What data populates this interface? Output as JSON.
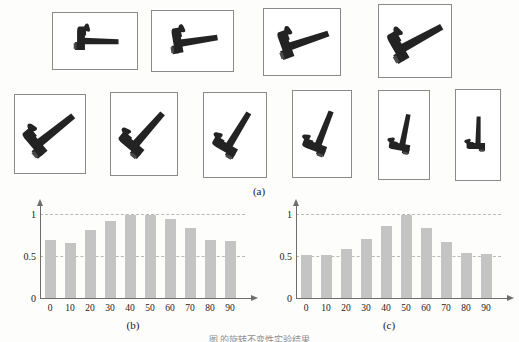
{
  "figure": {
    "panel_a_label": "(a)",
    "panel_b_label": "(b)",
    "panel_c_label": "(c)",
    "caption": "图            的旋转不变性实验结果",
    "bar_color": "#c4c4c4",
    "axis_color": "#6d6d6d",
    "grid_color": "#b9b9b9",
    "frame_color": "#8a8a8a",
    "hammer_color": "#232323"
  },
  "gallery": {
    "name": "hammer-rotation-sequence",
    "items": [
      {
        "angle_label": "0",
        "rotation": 0,
        "x": 52,
        "y": 12,
        "w": 86,
        "h": 58
      },
      {
        "angle_label": "10",
        "rotation": 10,
        "x": 151,
        "y": 10,
        "w": 83,
        "h": 62
      },
      {
        "angle_label": "20",
        "rotation": 20,
        "x": 263,
        "y": 8,
        "w": 78,
        "h": 68
      },
      {
        "angle_label": "30",
        "rotation": 30,
        "x": 378,
        "y": 4,
        "w": 74,
        "h": 74
      },
      {
        "angle_label": "40",
        "rotation": 40,
        "x": 14,
        "y": 94,
        "w": 72,
        "h": 80
      },
      {
        "angle_label": "50",
        "rotation": 50,
        "x": 110,
        "y": 92,
        "w": 68,
        "h": 84
      },
      {
        "angle_label": "60",
        "rotation": 60,
        "x": 203,
        "y": 92,
        "w": 64,
        "h": 86
      },
      {
        "angle_label": "70",
        "rotation": 70,
        "x": 292,
        "y": 90,
        "w": 60,
        "h": 88
      },
      {
        "angle_label": "80",
        "rotation": 80,
        "x": 378,
        "y": 90,
        "w": 52,
        "h": 90
      },
      {
        "angle_label": "90",
        "rotation": 90,
        "x": 455,
        "y": 89,
        "w": 46,
        "h": 92
      }
    ]
  },
  "chart_data": [
    {
      "type": "bar",
      "name": "chart-b",
      "title": "(b)",
      "categories": [
        "0",
        "10",
        "20",
        "30",
        "40",
        "50",
        "60",
        "70",
        "80",
        "90"
      ],
      "values": [
        0.7,
        0.67,
        0.82,
        0.93,
        1.0,
        1.0,
        0.95,
        0.85,
        0.7,
        0.69
      ],
      "xlabel": "",
      "ylabel": "",
      "ylim": [
        0,
        1.05
      ],
      "yticks": [
        0,
        0.5,
        1
      ],
      "ytick_labels": [
        "0",
        "0.5",
        "1"
      ],
      "gridlines": [
        0.5,
        1
      ],
      "grid": true,
      "legend": "none"
    },
    {
      "type": "bar",
      "name": "chart-c",
      "title": "(c)",
      "categories": [
        "0",
        "10",
        "20",
        "30",
        "40",
        "50",
        "60",
        "70",
        "80",
        "90"
      ],
      "values": [
        0.53,
        0.52,
        0.6,
        0.72,
        0.87,
        1.0,
        0.85,
        0.68,
        0.55,
        0.54
      ],
      "xlabel": "",
      "ylabel": "",
      "ylim": [
        0,
        1.05
      ],
      "yticks": [
        0,
        0.5,
        1
      ],
      "ytick_labels": [
        "0",
        "0.5",
        "1"
      ],
      "gridlines": [
        0.5,
        1
      ],
      "grid": true,
      "legend": "none"
    }
  ]
}
